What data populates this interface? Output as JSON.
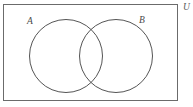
{
  "figure": {
    "type": "venn-diagram",
    "background_color": "#ffffff",
    "stroke_color": "#555555",
    "universe": {
      "label": "U",
      "label_name": "universal-set-label",
      "shape": "rectangle",
      "x": 3.5,
      "y": 4.5,
      "width": 174,
      "height": 96,
      "stroke_width": 1,
      "stroke_color": "#6b6b6b",
      "fill": "none",
      "label_x": 183,
      "label_y": 6
    },
    "sets": [
      {
        "label": "A",
        "name": "set-a-circle",
        "cx": 66,
        "cy": 56,
        "r": 36.5,
        "stroke_width": 1,
        "stroke_color": "#555555",
        "fill": "none",
        "label_x": 30,
        "label_y": 22
      },
      {
        "label": "B",
        "name": "set-b-circle",
        "cx": 116,
        "cy": 56,
        "r": 36.5,
        "stroke_width": 1,
        "stroke_color": "#555555",
        "fill": "none",
        "label_x": 142,
        "label_y": 21
      }
    ],
    "regions": {
      "intersection_shaded": false,
      "shading_color": "none"
    }
  }
}
